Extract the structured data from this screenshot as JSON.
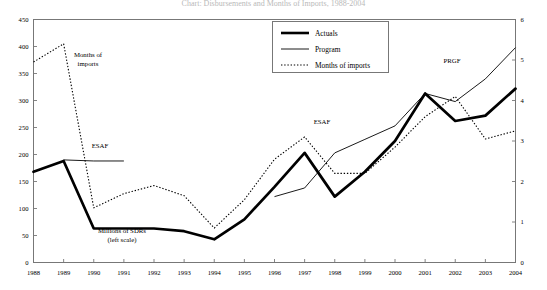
{
  "figure": {
    "title_clipped": "Chart: Disbursements and Months of Imports, 1988-2004",
    "legend": [
      {
        "label": "Actuals",
        "style": "thick-solid"
      },
      {
        "label": "Program",
        "style": "thin-solid"
      },
      {
        "label": "Months of imports",
        "style": "dotted"
      }
    ],
    "annotations": [
      {
        "name": "months-of-imports-annotation",
        "text": "Months of",
        "x": 88,
        "y": 57
      },
      {
        "name": "months-of-imports-annotation-line2",
        "text": "imports",
        "x": 88,
        "y": 66
      },
      {
        "name": "esaf-annotation-1",
        "text": "ESAF",
        "x": 100,
        "y": 148
      },
      {
        "name": "esaf-annotation-2",
        "text": "ESAF",
        "x": 322,
        "y": 124
      },
      {
        "name": "prgf-annotation",
        "text": "PRGF",
        "x": 452,
        "y": 63
      },
      {
        "name": "millions-of-sdrs-annotation",
        "text": "Millions of SDRs",
        "x": 122,
        "y": 233
      },
      {
        "name": "millions-of-sdrs-annotation-line2",
        "text": "(left scale)",
        "x": 122,
        "y": 242
      }
    ]
  },
  "chart_data": {
    "type": "line",
    "title": "Chart: Disbursements and Months of Imports, 1988-2004",
    "xlabel": "",
    "ylabel": "Millions of SDRs (left scale)",
    "y2label": "Months of imports (right scale)",
    "grid": false,
    "legend_position": "top-center",
    "categories": [
      "1988",
      "1989",
      "1990",
      "1991",
      "1992",
      "1993",
      "1994",
      "1995",
      "1996",
      "1997",
      "1998",
      "1999",
      "2000",
      "2001",
      "2002",
      "2003",
      "2004"
    ],
    "ylim": [
      0,
      450
    ],
    "yticks": [
      0,
      50,
      100,
      150,
      200,
      250,
      300,
      350,
      400,
      450
    ],
    "y2lim": [
      0,
      6
    ],
    "y2ticks": [
      0,
      1,
      2,
      3,
      4,
      5,
      6
    ],
    "series": [
      {
        "name": "Actuals",
        "axis": "left",
        "units": "Millions of SDRs",
        "style": "thick-solid",
        "x": [
          "1988",
          "1989",
          "1990",
          "1991",
          "1992",
          "1993",
          "1994",
          "1995",
          "1996",
          "1997",
          "1998",
          "1999",
          "2000",
          "2001",
          "2002",
          "2003",
          "2004"
        ],
        "values": [
          168,
          188,
          63,
          63,
          63,
          58,
          43,
          80,
          140,
          203,
          122,
          168,
          225,
          313,
          262,
          272,
          322
        ]
      },
      {
        "name": "Program",
        "axis": "left",
        "units": "Millions of SDRs",
        "style": "thin-solid",
        "segments": [
          {
            "name": "esaf-program-1",
            "x": [
              "1989",
              "1990",
              "1991"
            ],
            "values": [
              190,
              188,
              188
            ]
          },
          {
            "name": "esaf-program-2",
            "x": [
              "1996",
              "1997",
              "1998",
              "1999",
              "2000",
              "2001"
            ],
            "values": [
              122,
              138,
              203,
              228,
              253,
              313
            ]
          },
          {
            "name": "prgf-program",
            "x": [
              "2001",
              "2002",
              "2003",
              "2004"
            ],
            "values": [
              313,
              298,
              340,
              398
            ]
          }
        ]
      },
      {
        "name": "Months of imports",
        "axis": "right",
        "units": "Months",
        "style": "dotted",
        "x": [
          "1988",
          "1989",
          "1990",
          "1991",
          "1992",
          "1993",
          "1994",
          "1995",
          "1996",
          "1997",
          "1998",
          "1999",
          "2000",
          "2001",
          "2002",
          "2003",
          "2004"
        ],
        "values": [
          4.95,
          5.4,
          1.35,
          1.7,
          1.9,
          1.65,
          0.85,
          1.55,
          2.55,
          3.1,
          2.2,
          2.2,
          2.85,
          3.6,
          4.1,
          3.05,
          3.25
        ]
      }
    ]
  }
}
